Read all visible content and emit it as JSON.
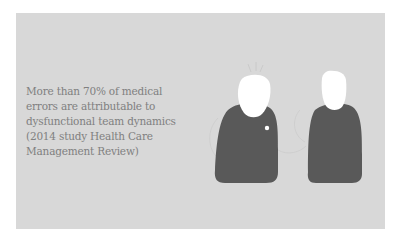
{
  "slide": {
    "quote_lines": [
      "More than 70% of medical",
      "errors are attributable to",
      "dysfunctional team dynamics",
      "(2014 study Health Care",
      "Management Review)"
    ],
    "illustration": {
      "figures": [
        "person-left",
        "person-right"
      ],
      "colors": {
        "background": "#d8d8d8",
        "body": "#595959",
        "head": "#ffffff",
        "text": "#808080"
      }
    }
  }
}
